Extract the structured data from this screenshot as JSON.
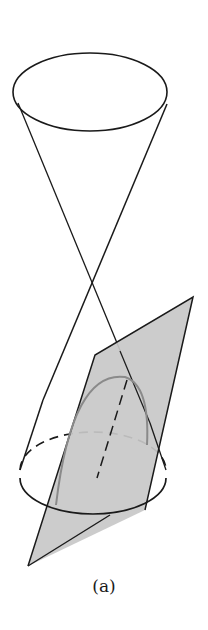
{
  "figure": {
    "caption": "(a)",
    "colors": {
      "stroke": "#1a1a1a",
      "plane_fill": "#c8c8c8",
      "curve": "#8a8a8a",
      "background": "#ffffff"
    },
    "elements": [
      "upper-nappe-rim-ellipse",
      "cone-generator-lines",
      "apex",
      "lower-nappe-base-ellipse",
      "cone-axis-dashed",
      "cutting-plane",
      "parabola-section"
    ]
  }
}
